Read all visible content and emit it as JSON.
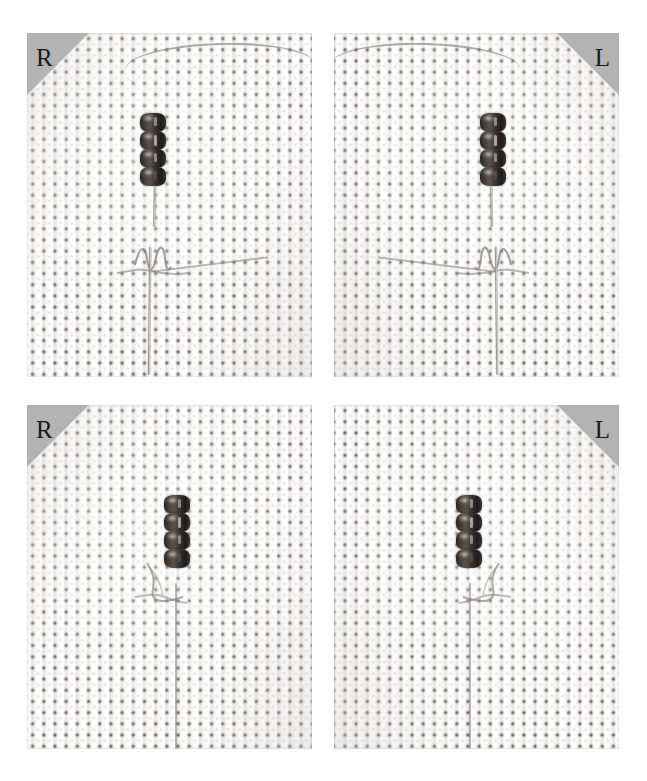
{
  "figure": {
    "background_color": "#ffffff",
    "panel_count": 4,
    "layout": "2x2 grid of macro photographs"
  },
  "marker": {
    "triangle_color": "#b3b3b3",
    "text_color": "#1a1a1a"
  },
  "panels": [
    {
      "id": "panel-top-left",
      "label": "R",
      "label_corner": "top-left",
      "row": "top",
      "column": "left",
      "bead_count": 4,
      "x": 27,
      "y": 33,
      "width": 285,
      "height": 344
    },
    {
      "id": "panel-top-right",
      "label": "L",
      "label_corner": "top-right",
      "row": "top",
      "column": "right",
      "bead_count": 4,
      "x": 334,
      "y": 33,
      "width": 285,
      "height": 344
    },
    {
      "id": "panel-bottom-left",
      "label": "R",
      "label_corner": "top-left",
      "row": "bottom",
      "column": "left",
      "bead_count": 4,
      "x": 27,
      "y": 405,
      "width": 285,
      "height": 344
    },
    {
      "id": "panel-bottom-right",
      "label": "L",
      "label_corner": "top-right",
      "row": "bottom",
      "column": "right",
      "bead_count": 4,
      "x": 334,
      "y": 405,
      "width": 285,
      "height": 344
    }
  ]
}
